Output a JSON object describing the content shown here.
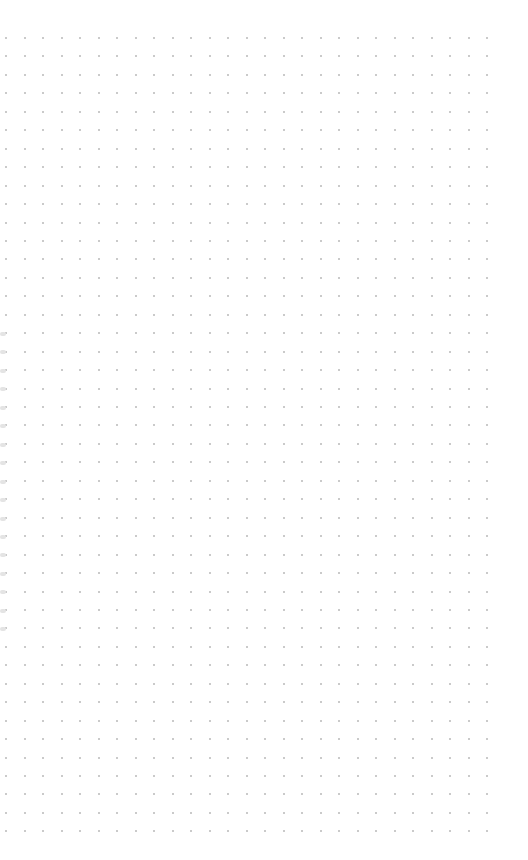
{
  "page": {
    "type": "dot-grid-paper",
    "background": "#ffffff"
  },
  "grid": {
    "origin_x": 5,
    "origin_y": 37,
    "spacing_x": 18.5,
    "spacing_y": 18.45,
    "columns": 27,
    "rows": 44,
    "dot_color": "#b8b8b8"
  },
  "binding_holes": {
    "x": 0,
    "start_y": 332,
    "spacing": 18.45,
    "count": 17,
    "color": "#e4e4e4"
  }
}
